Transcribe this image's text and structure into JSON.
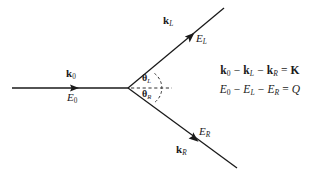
{
  "figure": {
    "type": "physics-scattering-diagram",
    "background_color": "#ffffff",
    "stroke_color": "#1a1a1a"
  },
  "incoming": {
    "momentum_label": "k",
    "momentum_sub": "0",
    "energy_label": "E",
    "energy_sub": "0"
  },
  "outgoing_left": {
    "momentum_label": "k",
    "momentum_sub": "L",
    "energy_label": "E",
    "energy_sub": "L",
    "angle_label": "θ",
    "angle_sub": "L"
  },
  "outgoing_right": {
    "momentum_label": "k",
    "momentum_sub": "R",
    "energy_label": "E",
    "energy_sub": "R",
    "angle_label": "θ",
    "angle_sub": "R"
  },
  "equations": {
    "momentum_conservation": "k₀ − k_L − k_R = K",
    "energy_conservation": "E₀ − E_L − E_R = Q",
    "momentum_result_symbol": "K",
    "energy_result_symbol": "Q",
    "minus_sign": "−",
    "equals_sign": "="
  },
  "geometry": {
    "vertex_x": 128,
    "vertex_y": 88,
    "incoming_start_x": 12,
    "upper_end_x": 224,
    "upper_end_y": 8,
    "lower_end_x": 237,
    "lower_end_y": 168,
    "dashed_axis_end_x": 172
  }
}
